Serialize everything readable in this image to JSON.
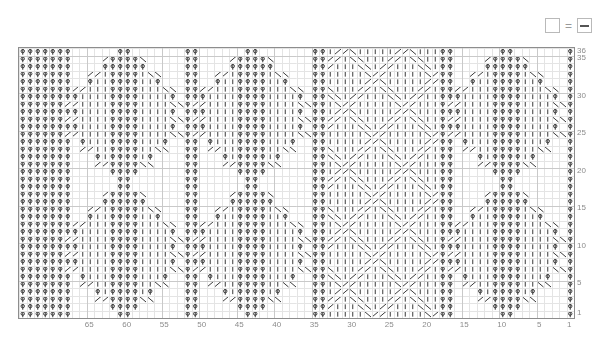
{
  "document": {
    "type": "knitting-chart",
    "title": "Cable Knitting Chart"
  },
  "legend": {
    "empty_symbol_name": "blank-cell",
    "equals": "=",
    "purl_symbol_name": "purl-dash",
    "meaning": "blank = purl"
  },
  "chart_data": {
    "type": "heatmap",
    "title": "",
    "xlabel": "",
    "ylabel": "",
    "columns": 74,
    "rows": 36,
    "cell_width": 7.5,
    "cell_height": 7.5,
    "column_tick_labels": [
      "65",
      "60",
      "55",
      "50",
      "45",
      "40",
      "35",
      "30",
      "25",
      "20",
      "15",
      "10",
      "5",
      "1"
    ],
    "column_tick_values": [
      65,
      60,
      55,
      50,
      45,
      40,
      35,
      30,
      25,
      20,
      15,
      10,
      5,
      1
    ],
    "row_tick_labels": [
      "36",
      "35",
      "30",
      "25",
      "20",
      "15",
      "10",
      "5",
      "1"
    ],
    "row_tick_values": [
      36,
      35,
      30,
      25,
      20,
      15,
      10,
      5,
      1
    ],
    "column_direction": "right-to-left",
    "row_direction": "bottom-to-top",
    "grid": true,
    "legend_position": "top-right",
    "symbols": {
      "p": "purl",
      "k": "knit",
      "rc": "right-cross-cable",
      "lc": "left-cross-cable",
      "b": "blank"
    },
    "colors": {
      "grid_minor": "#e4e4e4",
      "grid_major": "#c9c9c9",
      "border": "#8d8d8d",
      "symbol": "#3a3a3a",
      "axis_text": "#8c8c8c",
      "background": "#ffffff"
    },
    "panels": [
      {
        "name": "panel-left-diamond",
        "start_col": 68,
        "end_col": 74,
        "motif": "purl-ground"
      },
      {
        "name": "panel-diamond-a",
        "start_col": 53,
        "end_col": 67,
        "motif": "diamond-cable"
      },
      {
        "name": "panel-separator-a",
        "start_col": 51,
        "end_col": 52,
        "motif": "purl-column"
      },
      {
        "name": "panel-diamond-b",
        "start_col": 36,
        "end_col": 50,
        "motif": "diamond-cable"
      },
      {
        "name": "panel-separator-b",
        "start_col": 34,
        "end_col": 35,
        "motif": "purl-column"
      },
      {
        "name": "panel-lattice",
        "start_col": 19,
        "end_col": 33,
        "motif": "lattice-cable"
      },
      {
        "name": "panel-separator-c",
        "start_col": 17,
        "end_col": 18,
        "motif": "purl-column"
      },
      {
        "name": "panel-diamond-c",
        "start_col": 2,
        "end_col": 16,
        "motif": "diamond-cable"
      },
      {
        "name": "panel-right-edge",
        "start_col": 1,
        "end_col": 1,
        "motif": "purl-column"
      }
    ]
  }
}
